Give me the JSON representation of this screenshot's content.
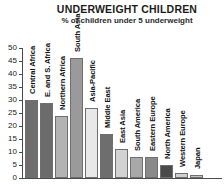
{
  "chart_data": {
    "type": "bar",
    "title": "UNDERWEIGHT CHILDREN",
    "subtitle": "% of children under 5 underweight",
    "xlabel": "",
    "ylabel": "",
    "ylim": [
      0,
      50
    ],
    "yticks": [
      0,
      5,
      10,
      15,
      20,
      25,
      30,
      35,
      40,
      45,
      50
    ],
    "grid": false,
    "legend": "none",
    "categories": [
      "Central Africa",
      "E. and S. Africa",
      "Northern Africa",
      "South Asia",
      "Asia-Pacific",
      "Middle East",
      "East Asia",
      "South America",
      "Eastern Europe",
      "North America",
      "Western Europe",
      "Japan"
    ],
    "values": [
      30,
      29,
      24,
      46,
      27,
      17,
      11,
      8,
      8,
      5,
      2,
      1
    ],
    "bar_colors": [
      "#6e6e6e",
      "#6b6b6b",
      "#b3b3b3",
      "#9a9a9a",
      "#e8e8e8",
      "#6e6e6e",
      "#d2d2d2",
      "#a8a8a8",
      "#8a8a8a",
      "#4a4a4a",
      "#cfcfcf",
      "#c2c2c2"
    ]
  },
  "colors": {
    "axis": "#4a4a4a",
    "text": "#1a1a1a",
    "background": "#ffffff"
  }
}
